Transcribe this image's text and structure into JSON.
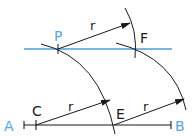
{
  "diagram": {
    "colors": {
      "line": "#1a1a1a",
      "accent": "#4a9fd8",
      "label_blue": "#5aa5dc"
    },
    "points": {
      "A": {
        "label": "A",
        "x": 24,
        "y": 125
      },
      "B": {
        "label": "B",
        "x": 171,
        "y": 125
      },
      "C": {
        "label": "C",
        "x": 36,
        "y": 125
      },
      "E": {
        "label": "E",
        "x": 114,
        "y": 125
      },
      "P": {
        "label": "P",
        "x": 58,
        "y": 49
      },
      "F": {
        "label": "F",
        "x": 135,
        "y": 49
      }
    },
    "radius_label": "r",
    "labels": {
      "A": "A",
      "B": "B",
      "C": "C",
      "E": "E",
      "P": "P",
      "F": "F",
      "r1": "r",
      "r2": "r",
      "r3": "r"
    }
  }
}
